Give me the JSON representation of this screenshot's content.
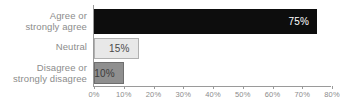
{
  "chart_data": {
    "type": "bar",
    "orientation": "horizontal",
    "title": "",
    "subtitle": "",
    "xlabel": "",
    "ylabel": "",
    "categories": [
      "Agree or\nstrongly agree",
      "Neutral",
      "Disagree or\nstrongly disagree"
    ],
    "values": [
      75,
      15,
      10
    ],
    "value_labels": [
      "75%",
      "15%",
      "10%"
    ],
    "bar_colors": [
      "#0d0d0d",
      "#e8e8e8",
      "#8f8f8f"
    ],
    "value_label_colors": [
      "#ffffff",
      "#4a4a4a",
      "#3c3c3c"
    ],
    "xlim": [
      0,
      80
    ],
    "xticks": [
      0,
      10,
      20,
      30,
      40,
      50,
      60,
      70,
      80
    ],
    "xtick_labels": [
      "0%",
      "10%",
      "20%",
      "30%",
      "40%",
      "50%",
      "60%",
      "70%",
      "80%"
    ],
    "grid": false,
    "legend": null,
    "axis_color": "#9a9a9a",
    "label_color": "#8c8c8c"
  }
}
